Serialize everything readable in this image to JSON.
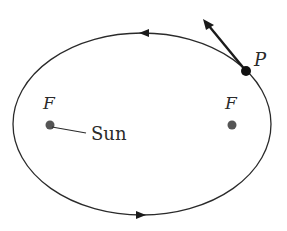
{
  "diagram": {
    "title": "",
    "orbit": {
      "shape": "ellipse",
      "direction": "counterclockwise",
      "color": "#2a2a2a"
    },
    "foci": [
      {
        "label": "F",
        "x": 50,
        "y": 125,
        "note": "Sun"
      },
      {
        "label": "F",
        "x": 232,
        "y": 125
      }
    ],
    "sun_label": "Sun",
    "point": {
      "label": "P",
      "x": 246,
      "y": 71
    },
    "velocity_vector": {
      "from": [
        246,
        71
      ],
      "to": [
        205,
        20
      ]
    },
    "colors": {
      "ink": "#2a2a2a",
      "background": "#ffffff",
      "focus_dot": "#555555"
    }
  }
}
